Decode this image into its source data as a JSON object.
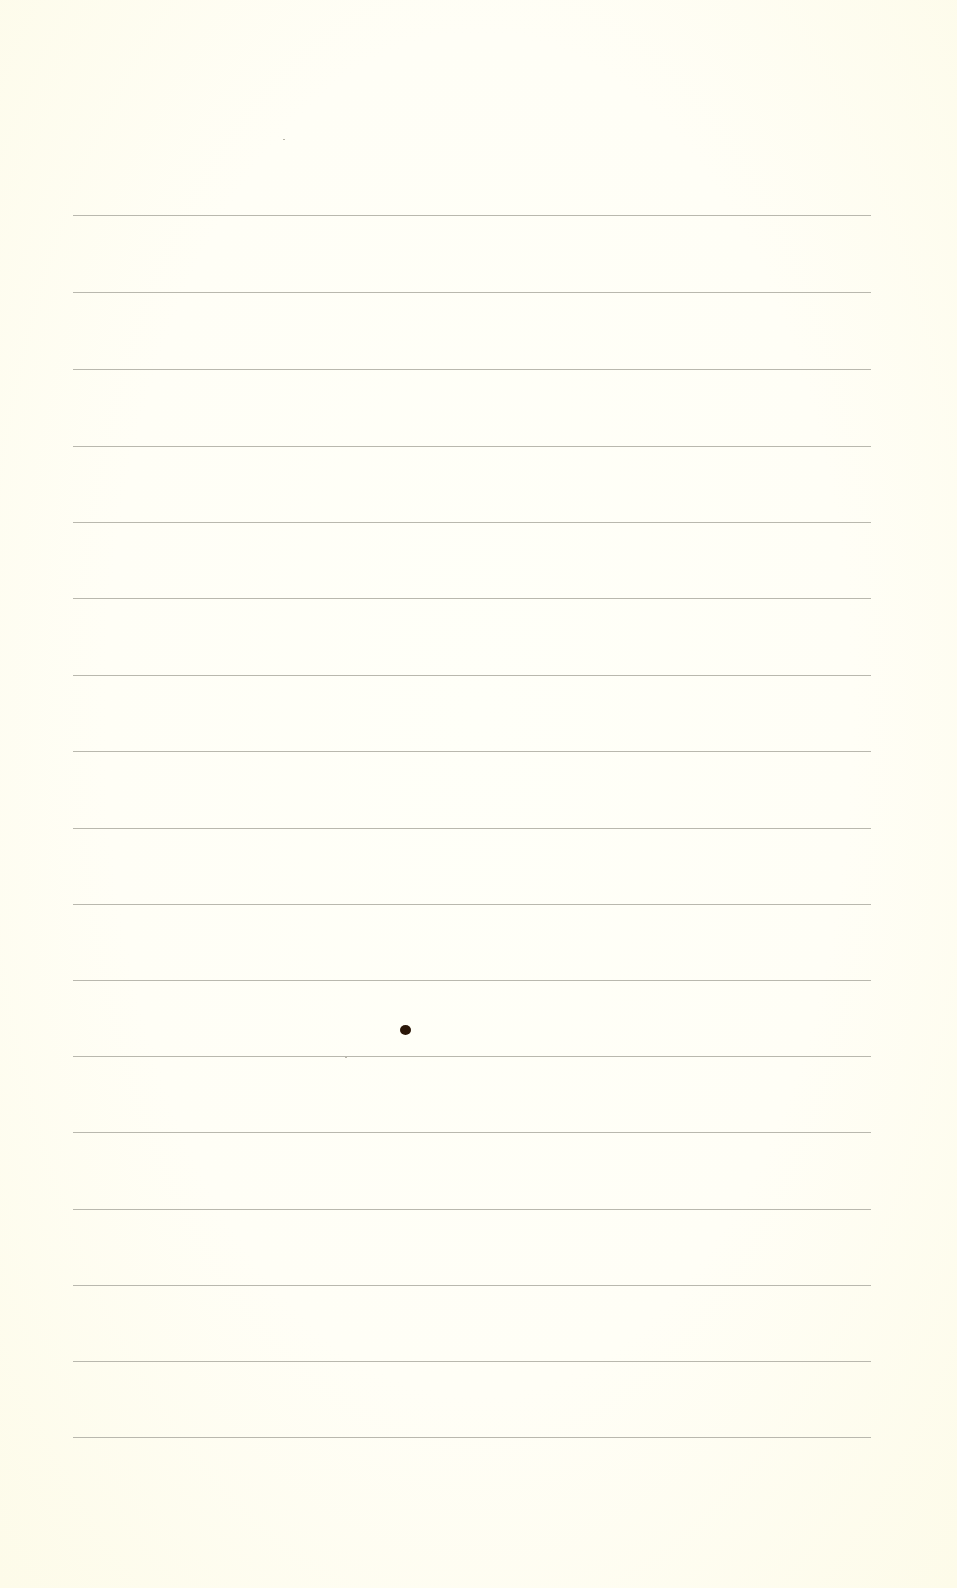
{
  "document": {
    "type": "ruled-paper",
    "background_color": "#fffdf2",
    "rule_color": "#b9b8ae",
    "rules": {
      "count": 17,
      "left": 73,
      "width": 798,
      "y_positions": [
        215,
        292,
        369,
        446,
        522,
        598,
        675,
        751,
        828,
        904,
        980,
        1056,
        1132,
        1209,
        1285,
        1361,
        1437
      ]
    },
    "marks": [
      {
        "kind": "ink-dot",
        "x": 400,
        "y": 1025,
        "color": "#2a1608"
      }
    ],
    "specks": [
      {
        "x": 283,
        "y": 139
      },
      {
        "x": 345,
        "y": 1057
      }
    ]
  }
}
